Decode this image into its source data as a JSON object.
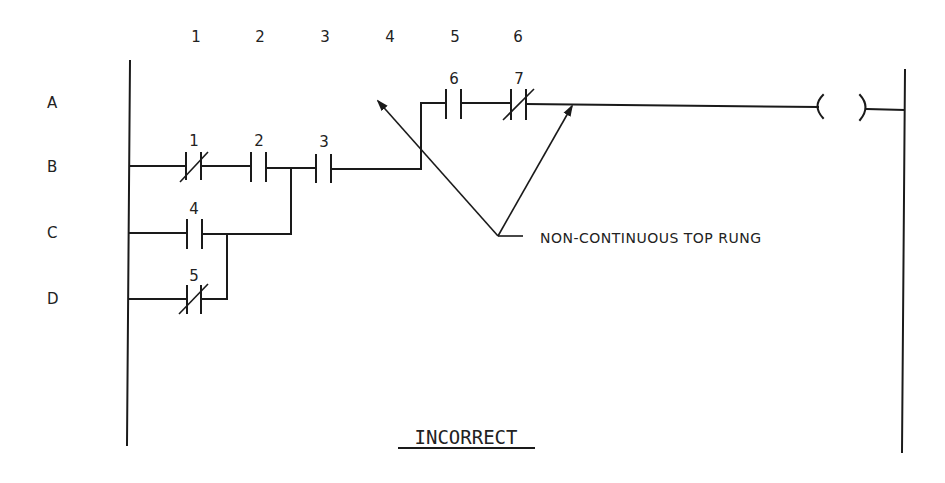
{
  "diagram": {
    "type": "ladder-logic",
    "column_labels": [
      "1",
      "2",
      "3",
      "4",
      "5",
      "6"
    ],
    "row_labels": [
      "A",
      "B",
      "C",
      "D"
    ],
    "contacts": [
      {
        "id": "1",
        "kind": "normally-closed",
        "row": "B"
      },
      {
        "id": "2",
        "kind": "normally-open",
        "row": "B"
      },
      {
        "id": "3",
        "kind": "normally-open",
        "row": "B"
      },
      {
        "id": "4",
        "kind": "normally-open",
        "row": "C"
      },
      {
        "id": "5",
        "kind": "normally-closed",
        "row": "D"
      },
      {
        "id": "6",
        "kind": "normally-open",
        "row": "A"
      },
      {
        "id": "7",
        "kind": "normally-closed",
        "row": "A"
      }
    ],
    "coil": {
      "symbol": "( )",
      "row": "A"
    },
    "annotation": "NON-CONTINUOUS TOP RUNG",
    "caption": "INCORRECT"
  }
}
